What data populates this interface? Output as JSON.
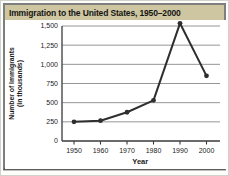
{
  "figure": {
    "title": "Immigration to the United States, 1950–2000"
  },
  "chart_data": {
    "type": "line",
    "title": "Immigration to the United States, 1950–2000",
    "categories": [
      "1950",
      "1960",
      "1970",
      "1980",
      "1990",
      "2000"
    ],
    "values": [
      250,
      265,
      375,
      530,
      1535,
      850
    ],
    "xlabel": "Year",
    "ylabel": "Number of Immigrants (in thousands)",
    "ylabel_lines": [
      "Number of Immigrants",
      "(in thousands)"
    ],
    "yticks": [
      0,
      250,
      500,
      750,
      1000,
      1250,
      1500
    ],
    "ylim": [
      0,
      1550
    ],
    "grid": true,
    "legend": "none",
    "marker": "filled-circle",
    "colors": {
      "line": "#2e2e2e",
      "marker": "#2e2e2e",
      "grid": "#8a8a8a",
      "axis": "#3a3a3a",
      "tick_text": "#1a1a1a",
      "title_bar_bg": "#cdc6a0",
      "title_text": "#151515",
      "frame_border": "#7e7e7e"
    }
  }
}
